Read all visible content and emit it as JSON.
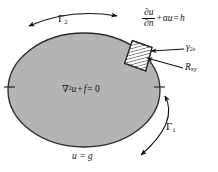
{
  "figure": {
    "domain_label": "R_xy",
    "colors": {
      "domain_fill": "#b4b4b4",
      "outline": "#2b2b2b",
      "element_fill": "#ffffff",
      "hatch": "#2b2b2b",
      "background": "#ffffff",
      "text": "#141414"
    },
    "labels": {
      "gamma2_boundary": "Γ",
      "gamma2_subscript": "2",
      "gamma1_boundary": "Γ",
      "gamma1_subscript": "1",
      "element_gamma": "γ",
      "element_gamma_subscript": "2e",
      "region_symbol": "R",
      "region_subscript": "xy",
      "governing_nabla": "∇",
      "governing_nabla_power": "2",
      "governing_u": "u",
      "governing_plus": "+",
      "governing_f": "f",
      "governing_equals": "= 0",
      "dirichlet_condition": "u = g",
      "robin_num": "∂u",
      "robin_den": "∂n",
      "robin_plus": "+",
      "robin_alpha": "α",
      "robin_u": "u",
      "robin_equals": "=",
      "robin_h": "h"
    },
    "icon_names": {
      "gamma2_arc_arrow": "double-arrow-arc-icon",
      "gamma1_arc_arrow": "double-arrow-arc-icon",
      "gamma2e_leader": "leader-arrow-icon",
      "rxy_leader": "leader-arrow-icon",
      "left_tick": "tick-mark-icon",
      "right_tick": "tick-mark-icon"
    }
  }
}
